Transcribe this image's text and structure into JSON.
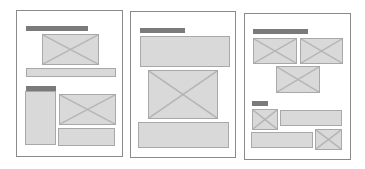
{
  "diagram": {
    "type": "wireframe-page-layouts",
    "colors": {
      "page_border": "#8a8a8a",
      "block_fill": "#d9d9d9",
      "block_border": "#a8a8a8",
      "heading_bar": "#7a7a7a",
      "cross": "#b5b5b5"
    },
    "pages": [
      {
        "id": "layout-1",
        "elements": [
          "heading-bar",
          "image-placeholder",
          "text-block",
          "heading-bar",
          "tall-text-block",
          "image-placeholder",
          "text-block"
        ]
      },
      {
        "id": "layout-2",
        "elements": [
          "heading-bar",
          "text-block",
          "image-placeholder",
          "text-block"
        ]
      },
      {
        "id": "layout-3",
        "elements": [
          "heading-bar",
          "image-placeholder",
          "image-placeholder",
          "image-placeholder",
          "heading-bar",
          "image-placeholder",
          "text-block",
          "text-block",
          "image-placeholder"
        ]
      }
    ]
  }
}
